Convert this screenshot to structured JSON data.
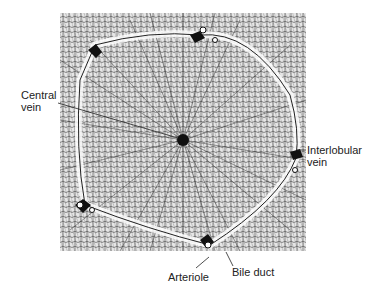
{
  "figure": {
    "labels": {
      "central_vein": {
        "line1": "Central",
        "line2": "vein"
      },
      "interlobular_vein": {
        "line1": "Interlobular",
        "line2": "vein"
      },
      "arteriole": "Arteriole",
      "bile_duct": "Bile duct"
    },
    "colors": {
      "ink": "#111111",
      "paper": "#ffffff",
      "tissue": "#bdbdbd"
    }
  }
}
